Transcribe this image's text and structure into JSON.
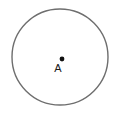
{
  "figure": {
    "type": "geometry-diagram",
    "canvas": {
      "width": 123,
      "height": 120,
      "background_color": "#ffffff"
    },
    "circle": {
      "name": "circle-outline",
      "center_x": 60,
      "center_y": 57,
      "radius": 48,
      "stroke_color": "#6e6e6e",
      "stroke_width": 1.4,
      "fill_color": "#ffffff"
    },
    "center_point": {
      "name": "center-point",
      "x": 62,
      "y": 59,
      "radius": 2.4,
      "color": "#111111"
    },
    "label": {
      "name": "point-label-a",
      "text": "A",
      "x": 58,
      "y": 72,
      "font_size": 11,
      "color": "#1a1a1a"
    }
  }
}
